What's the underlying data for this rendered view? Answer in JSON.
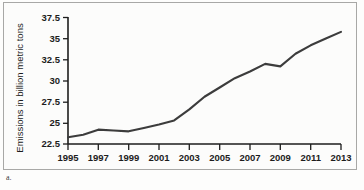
{
  "figure": {
    "caption_label": "a.",
    "type": "line-chart-figure"
  },
  "chart_data": {
    "type": "line",
    "title": "",
    "subtitle": "",
    "xlabel": "",
    "ylabel": "Emissions in billion metric tons",
    "x": [
      1995,
      1996,
      1997,
      1998,
      1999,
      2000,
      2001,
      2002,
      2003,
      2004,
      2005,
      2006,
      2007,
      2008,
      2009,
      2010,
      2011,
      2012,
      2013
    ],
    "values": [
      23.3,
      23.6,
      24.2,
      24.1,
      24.0,
      24.4,
      24.8,
      25.3,
      26.6,
      28.1,
      29.2,
      30.3,
      31.1,
      32.0,
      31.7,
      33.2,
      34.2,
      35.0,
      35.8
    ],
    "xtick_labels": [
      "1995",
      "1997",
      "1999",
      "2001",
      "2003",
      "2005",
      "2007",
      "2009",
      "2011",
      "2013"
    ],
    "xticks": [
      1995,
      1997,
      1999,
      2001,
      2003,
      2005,
      2007,
      2009,
      2011,
      2013
    ],
    "ytick_labels": [
      "22.5",
      "25",
      "27.5",
      "30",
      "32.5",
      "35",
      "37.5"
    ],
    "yticks": [
      22.5,
      25,
      27.5,
      30,
      32.5,
      35,
      37.5
    ],
    "xlim": [
      1995,
      2013
    ],
    "ylim": [
      22.5,
      37.5
    ],
    "grid": false,
    "legend": null,
    "series_color": "#3c3c3c",
    "axis_color": "#1d1d1d"
  }
}
